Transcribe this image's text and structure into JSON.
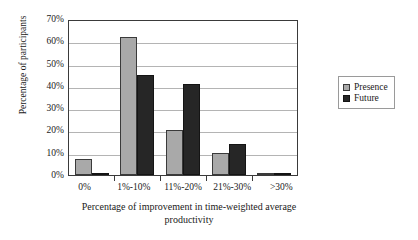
{
  "chart_data": {
    "type": "bar",
    "title": "",
    "subtitle": "",
    "categories": [
      "0%",
      "1%-10%",
      "11%-20%",
      "21%-30%",
      ">30%"
    ],
    "series": [
      {
        "name": "Presence",
        "color": "#a9a9a9",
        "values": [
          7,
          62,
          20,
          10,
          0
        ]
      },
      {
        "name": "Future",
        "color": "#262626",
        "values": [
          0.5,
          45,
          41,
          14,
          1
        ]
      }
    ],
    "xlabel": "Percentage of improvement in time-weighted average productivity",
    "ylabel": "Percentage of participants",
    "ylim": [
      0,
      70
    ],
    "ytick_values": [
      0,
      10,
      20,
      30,
      40,
      50,
      60,
      70
    ],
    "ytick_labels": [
      "0%",
      "10%",
      "20%",
      "30%",
      "40%",
      "50%",
      "60%",
      "70%"
    ],
    "grid": "horizontal",
    "legend_position": "right",
    "legend_entries": [
      "Presence",
      "Future"
    ]
  },
  "axes": {
    "y_title": "Percentage of participants",
    "x_title_line1": "Percentage of improvement in time-weighted average",
    "x_title_line2": "productivity"
  },
  "colors": {
    "presence": "#a9a9a9",
    "future": "#262626",
    "axis": "#3a3a3a",
    "grid": "#b4b4b4",
    "background": "#ffffff"
  }
}
